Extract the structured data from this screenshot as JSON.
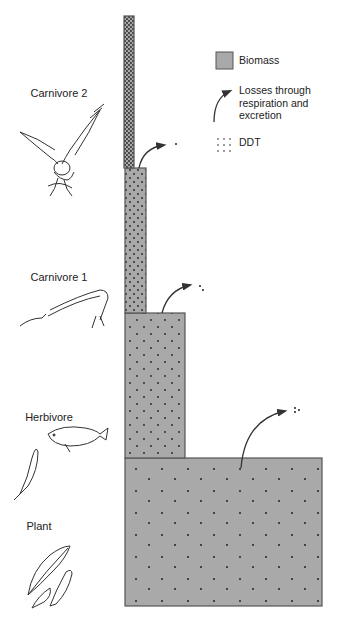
{
  "legend": {
    "biomass": "Biomass",
    "losses": "Losses through respiration and excretion",
    "losses_lines": [
      "Losses through",
      "respiration and",
      "excretion"
    ],
    "ddt": "DDT"
  },
  "levels": [
    {
      "name": "Carnivore 2",
      "icon": "bird-of-prey-icon"
    },
    {
      "name": "Carnivore 1",
      "icon": "needlefish-icon"
    },
    {
      "name": "Herbivore",
      "icon": "minnow-fish-icon"
    },
    {
      "name": "Plant",
      "icon": "plant-leaves-icon"
    }
  ],
  "colors": {
    "biomass_fill": "#a9a9a9",
    "outline": "#555555",
    "dot": "#222222"
  }
}
